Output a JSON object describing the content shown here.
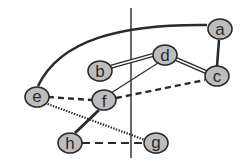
{
  "diagram": {
    "type": "graph",
    "nodes": [
      {
        "id": "a",
        "label": "a",
        "x": 220,
        "y": 29
      },
      {
        "id": "b",
        "label": "b",
        "x": 100,
        "y": 71
      },
      {
        "id": "c",
        "label": "c",
        "x": 217,
        "y": 76
      },
      {
        "id": "d",
        "label": "d",
        "x": 165,
        "y": 55
      },
      {
        "id": "e",
        "label": "e",
        "x": 37,
        "y": 97
      },
      {
        "id": "f",
        "label": "f",
        "x": 104,
        "y": 100
      },
      {
        "id": "g",
        "label": "g",
        "x": 156,
        "y": 143
      },
      {
        "id": "h",
        "label": "h",
        "x": 70,
        "y": 143
      }
    ],
    "edges": [
      {
        "from": "e",
        "to": "a",
        "style": "thick-curve"
      },
      {
        "from": "a",
        "to": "c",
        "style": "thick"
      },
      {
        "from": "b",
        "to": "d",
        "style": "double"
      },
      {
        "from": "d",
        "to": "c",
        "style": "double"
      },
      {
        "from": "d",
        "to": "f",
        "style": "thin"
      },
      {
        "from": "e",
        "to": "f",
        "style": "dashed"
      },
      {
        "from": "f",
        "to": "c",
        "style": "dashed"
      },
      {
        "from": "e",
        "to": "g",
        "style": "dotted"
      },
      {
        "from": "f",
        "to": "h",
        "style": "thick"
      },
      {
        "from": "h",
        "to": "g",
        "style": "long-dashed"
      }
    ],
    "cut_line": {
      "x": 131,
      "y1": 8,
      "y2": 158
    }
  }
}
